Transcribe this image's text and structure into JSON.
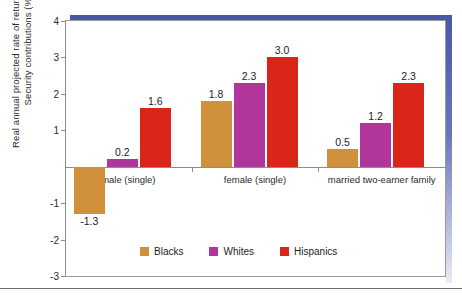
{
  "chart_data": {
    "type": "bar",
    "title": "",
    "xlabel": "",
    "ylabel": "Real annual projected rate of return on Social Security contributions (%)",
    "categories": [
      "male (single)",
      "female (single)",
      "married two-earner family"
    ],
    "series": [
      {
        "name": "Blacks",
        "color": "#d1913c",
        "values": [
          -1.3,
          1.8,
          0.5
        ]
      },
      {
        "name": "Whites",
        "color": "#b2359b",
        "values": [
          0.2,
          2.3,
          1.2
        ]
      },
      {
        "name": "Hispanics",
        "color": "#d92618",
        "values": [
          1.6,
          3.0,
          2.3
        ]
      }
    ],
    "ylim": [
      -3,
      4
    ],
    "yticks": [
      "4",
      "3",
      "2",
      "1",
      "-1",
      "-2",
      "-3"
    ],
    "ytick_values": [
      4,
      3,
      2,
      1,
      -1,
      -2,
      -3
    ],
    "value_labels": [
      "-1.3",
      "0.2",
      "1.6",
      "1.8",
      "2.3",
      "3.0",
      "0.5",
      "1.2",
      "2.3"
    ],
    "grid": false,
    "legend_position": "bottom"
  },
  "legend": {
    "items": [
      {
        "label": "Blacks",
        "color": "#d1913c"
      },
      {
        "label": "Whites",
        "color": "#b2359b"
      },
      {
        "label": "Hispanics",
        "color": "#d92618"
      }
    ]
  },
  "decor": {
    "frame_color": "#4a57a8",
    "axis_color": "#8d8d8d",
    "clipped_top_text": ""
  }
}
